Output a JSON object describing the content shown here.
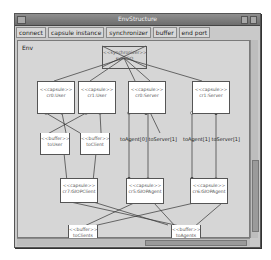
{
  "window": {
    "title": "EnvStructure"
  },
  "toolbar": {
    "tabs": [
      {
        "label": "connect"
      },
      {
        "label": "capsule instance"
      },
      {
        "label": "synchronizer"
      },
      {
        "label": "buffer"
      },
      {
        "label": "end port"
      }
    ]
  },
  "canvas": {
    "env_label": "Env",
    "synchronizer": {
      "stereotype": "<<synchronizer>>",
      "name": "syncGO"
    },
    "capsules": [
      {
        "id": "user0",
        "stereotype": "<<capsule>>",
        "name": "cr0:User"
      },
      {
        "id": "user1",
        "stereotype": "<<capsule>>",
        "name": "cr1:User"
      },
      {
        "id": "server0",
        "stereotype": "<<capsule>>",
        "name": "cr0:Server"
      },
      {
        "id": "server1",
        "stereotype": "<<capsule>>",
        "name": "cr1:Server"
      },
      {
        "id": "giopclient",
        "stereotype": "<<capsule>>",
        "name": "cr7:GIOPClient"
      },
      {
        "id": "giopagent0",
        "stereotype": "<<capsule>>",
        "name": "cr5:GIOPAgent"
      },
      {
        "id": "giopagent1",
        "stereotype": "<<capsule>>",
        "name": "cr6:GIOPAgent"
      }
    ],
    "buffers": [
      {
        "id": "bufuser",
        "stereotype": "<<buffer>>",
        "name": "toUser"
      },
      {
        "id": "bufclient",
        "stereotype": "<<buffer>>",
        "name": "toClient"
      },
      {
        "id": "bufclients",
        "stereotype": "<<buffer>>",
        "name": "toClients"
      },
      {
        "id": "bufagents",
        "stereotype": "<<buffer>>",
        "name": "toAgents"
      }
    ],
    "port_labels": [
      "toAgent[0] toServer[1]",
      "toAgent[1] toServer[1]"
    ]
  },
  "colors": {
    "window_bg": "#c9c9c9",
    "canvas_bg": "#d6d6d6",
    "node_bg": "#ffffff",
    "line": "#333333"
  }
}
